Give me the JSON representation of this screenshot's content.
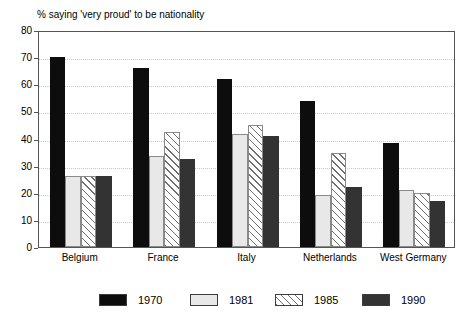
{
  "chart_data": {
    "type": "bar",
    "title": "% saying 'very proud' to be nationality",
    "xlabel": "",
    "ylabel": "",
    "ylim": [
      0,
      80
    ],
    "yticks": [
      0,
      10,
      20,
      30,
      40,
      50,
      60,
      70,
      80
    ],
    "grid": true,
    "legend_position": "bottom",
    "categories": [
      "Belgium",
      "France",
      "Italy",
      "Netherlands",
      "West Germany"
    ],
    "series": [
      {
        "name": "1970",
        "style": "solid-black",
        "color": "#0d0d0d",
        "values": [
          70,
          66,
          62,
          54,
          38.5
        ]
      },
      {
        "name": "1981",
        "style": "light-gray",
        "color": "#e8e8e8",
        "values": [
          26,
          33.5,
          41.5,
          19,
          21
        ]
      },
      {
        "name": "1985",
        "style": "diagonal-hatch",
        "color": "#ffffff",
        "values": [
          26,
          42.5,
          45,
          34.5,
          20
        ]
      },
      {
        "name": "1990",
        "style": "dark-gray",
        "color": "#333333",
        "values": [
          26,
          32.5,
          41,
          22,
          17
        ]
      }
    ]
  },
  "axis": {
    "y_tick_labels": [
      "0",
      "10",
      "20",
      "30",
      "40",
      "50",
      "60",
      "70",
      "80"
    ]
  },
  "legend": {
    "items": [
      {
        "label": "1970"
      },
      {
        "label": "1981"
      },
      {
        "label": "1985"
      },
      {
        "label": "1990"
      }
    ]
  }
}
